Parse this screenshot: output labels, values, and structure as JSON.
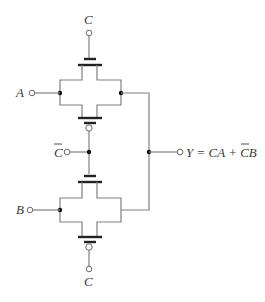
{
  "diagram": {
    "type": "CMOS transmission-gate multiplexer",
    "inputs": {
      "top_control": "C",
      "input_a": "A",
      "middle_control": "C",
      "middle_control_overbar": true,
      "input_b": "B",
      "bottom_control": "C"
    },
    "output": {
      "label": "Y = CA + CB",
      "parts": [
        "Y = ",
        "CA",
        " + ",
        "C",
        "B"
      ],
      "overbar_on": "C (second term)"
    },
    "colors": {
      "wire": "#808080",
      "transistor_bar": "#222222",
      "text": "#3a3a3a",
      "background": "#ffffff"
    }
  }
}
